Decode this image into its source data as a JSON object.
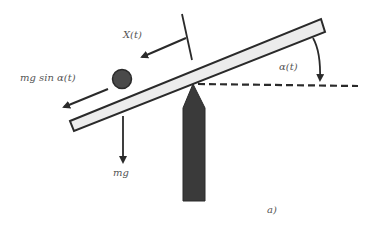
{
  "figure": {
    "panel_label": "a)",
    "labels": {
      "position": "X(t)",
      "force_along_beam": "mg sin α(t)",
      "weight": "mg",
      "angle": "α(t)"
    },
    "colors": {
      "outline": "#2a2a2a",
      "beam_fill": "#ececec",
      "fulcrum_fill": "#3a3a3a",
      "ball_fill": "#4a4a4a",
      "label_text": "#555555"
    }
  }
}
